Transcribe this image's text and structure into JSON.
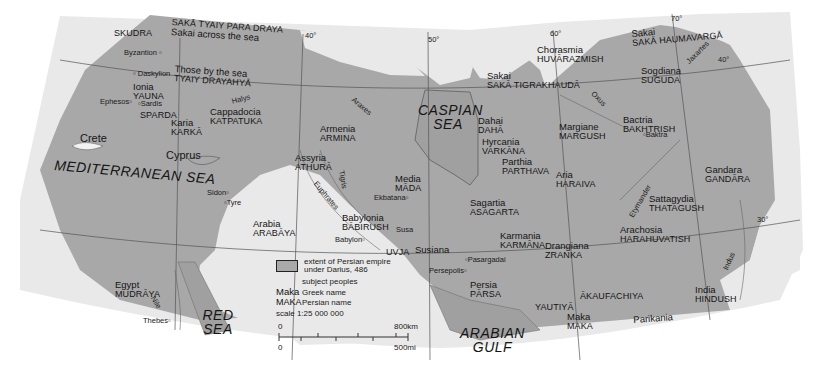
{
  "map": {
    "title": "Persian empire under Darius, 486",
    "colors": {
      "empire": "#a9a9a9",
      "land_outside": "#e8e8e8",
      "sea": "#a9a9a9",
      "background": "#ffffff",
      "lines": "#555555"
    },
    "regions": [
      {
        "greek": "",
        "persian": "SKUDRA"
      },
      {
        "greek": "Sakai across the sea",
        "persian": "SAKĀ TYAIY PARA DRAYA"
      },
      {
        "greek": "Those by the sea",
        "persian": "TYAIY DRAYAHYĀ"
      },
      {
        "greek": "Ionia",
        "persian": "YAUNA"
      },
      {
        "greek": "",
        "persian": "SPARDA"
      },
      {
        "greek": "Karia",
        "persian": "KARKĀ"
      },
      {
        "greek": "Cappadocia",
        "persian": "KATPATUKA"
      },
      {
        "greek": "Armenia",
        "persian": "ARMINA"
      },
      {
        "greek": "Assyria",
        "persian": "ATHURĀ"
      },
      {
        "greek": "Media",
        "persian": "MĀDA"
      },
      {
        "greek": "Babylonia",
        "persian": "BĀBIRUSH"
      },
      {
        "greek": "Arabia",
        "persian": "ARABĀYA"
      },
      {
        "greek": "Susiana",
        "persian": "UVJA"
      },
      {
        "greek": "Egypt",
        "persian": "MUDRĀYA"
      },
      {
        "greek": "Sakai",
        "persian": "SAKĀ TIGRAKHAUDĀ"
      },
      {
        "greek": "Dahai",
        "persian": "DAHĀ"
      },
      {
        "greek": "Hyrcania",
        "persian": "VARKĀNA"
      },
      {
        "greek": "Parthia",
        "persian": "PARTHAVA"
      },
      {
        "greek": "Chorasmia",
        "persian": "HUVĀRAZMISH"
      },
      {
        "greek": "Sakai",
        "persian": "SAKĀ HAUMAVARGĀ"
      },
      {
        "greek": "Sogdiana",
        "persian": "SUGUDA"
      },
      {
        "greek": "Bactria",
        "persian": "BAKHTRISH"
      },
      {
        "greek": "Margiane",
        "persian": "MARGUSH"
      },
      {
        "greek": "Aria",
        "persian": "HARAIVA"
      },
      {
        "greek": "Sagartia",
        "persian": "ASAGARTA"
      },
      {
        "greek": "Karmania",
        "persian": "KARMĀNA"
      },
      {
        "greek": "Drangiana",
        "persian": "ZRANKA"
      },
      {
        "greek": "Sattagydia",
        "persian": "THATAGUSH"
      },
      {
        "greek": "Arachosia",
        "persian": "HARAHUVATISH"
      },
      {
        "greek": "Gandara",
        "persian": "GANDĀRA"
      },
      {
        "greek": "Persia",
        "persian": "PĀRSA"
      },
      {
        "greek": "",
        "persian": "YAUTIYĀ"
      },
      {
        "greek": "",
        "persian": "ĀKAUFACHIYA"
      },
      {
        "greek": "Maka",
        "persian": "MAKA"
      },
      {
        "greek": "Parikania",
        "persian": ""
      },
      {
        "greek": "India",
        "persian": "HINDUSH"
      }
    ],
    "seas": [
      "MEDITERRANEAN SEA",
      "CASPIAN SEA",
      "RED SEA",
      "ARABIAN GULF"
    ],
    "islands": [
      "Crete",
      "Cyprus"
    ],
    "cities": [
      "Byzantion",
      "Daskylion",
      "Ephesos",
      "Sardis",
      "Sidon",
      "Tyre",
      "Ekbatana",
      "Babylon",
      "Susa",
      "Pasargadai",
      "Persepolis",
      "Baktra",
      "Thebes"
    ],
    "rivers": [
      "Halys",
      "Araxes",
      "Tigris",
      "Euphrates",
      "Oxus",
      "Jaxartes",
      "Etymander",
      "Indus",
      "Nile"
    ],
    "graticule": [
      "40°",
      "50°",
      "60°",
      "70°",
      "40°",
      "30°"
    ],
    "legend": {
      "swatch_label": "extent of Persian empire under Darius, 486",
      "subject_peoples": "subject peoples",
      "greek_key": "Maka",
      "greek_label": "Greek name",
      "persian_key": "MAKA",
      "persian_label": "Persian name",
      "scale": "scale 1:25 000 000",
      "km_zero": "0",
      "km_max": "800km",
      "mi_zero": "0",
      "mi_max": "500mi"
    }
  }
}
